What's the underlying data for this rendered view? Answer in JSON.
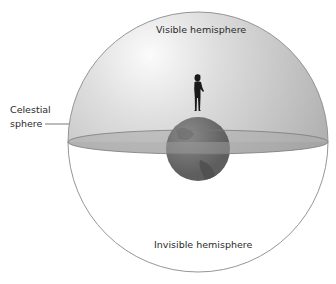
{
  "diagram": {
    "labels": {
      "visible": "Visible hemisphere",
      "invisible": "Invisible hemisphere",
      "celestial_line1": "Celestial",
      "celestial_line2": "sphere"
    },
    "colors": {
      "outline": "#8a8a8a",
      "dome_light": "#f2f2f2",
      "dome_dark": "#b4b4b4",
      "horizon_plane": "#a6a6a6",
      "earth": "#707070",
      "earth_dark": "#555555",
      "figure": "#1a1a1a"
    }
  }
}
